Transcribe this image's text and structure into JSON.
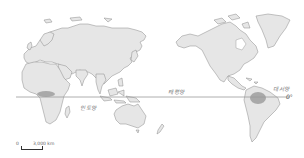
{
  "map": {
    "type": "world map (Pacific-centered)",
    "theme": "tropical rainforest distribution",
    "colors": {
      "land": "#e6e6e6",
      "coastline": "#8a8a8a",
      "rainforest": "#a9a9a9",
      "equator": "#9a9a9a",
      "background": "#ffffff"
    },
    "labels": {
      "indian_ocean": "인도양",
      "pacific_ocean": "태평양",
      "atlantic_ocean": "대서양",
      "equator": "0°"
    },
    "scale_bar": {
      "start": "0",
      "distance": "3,000 km"
    },
    "shaded_regions": [
      "Congo Basin (Africa)",
      "Amazon Basin (South America)"
    ]
  }
}
